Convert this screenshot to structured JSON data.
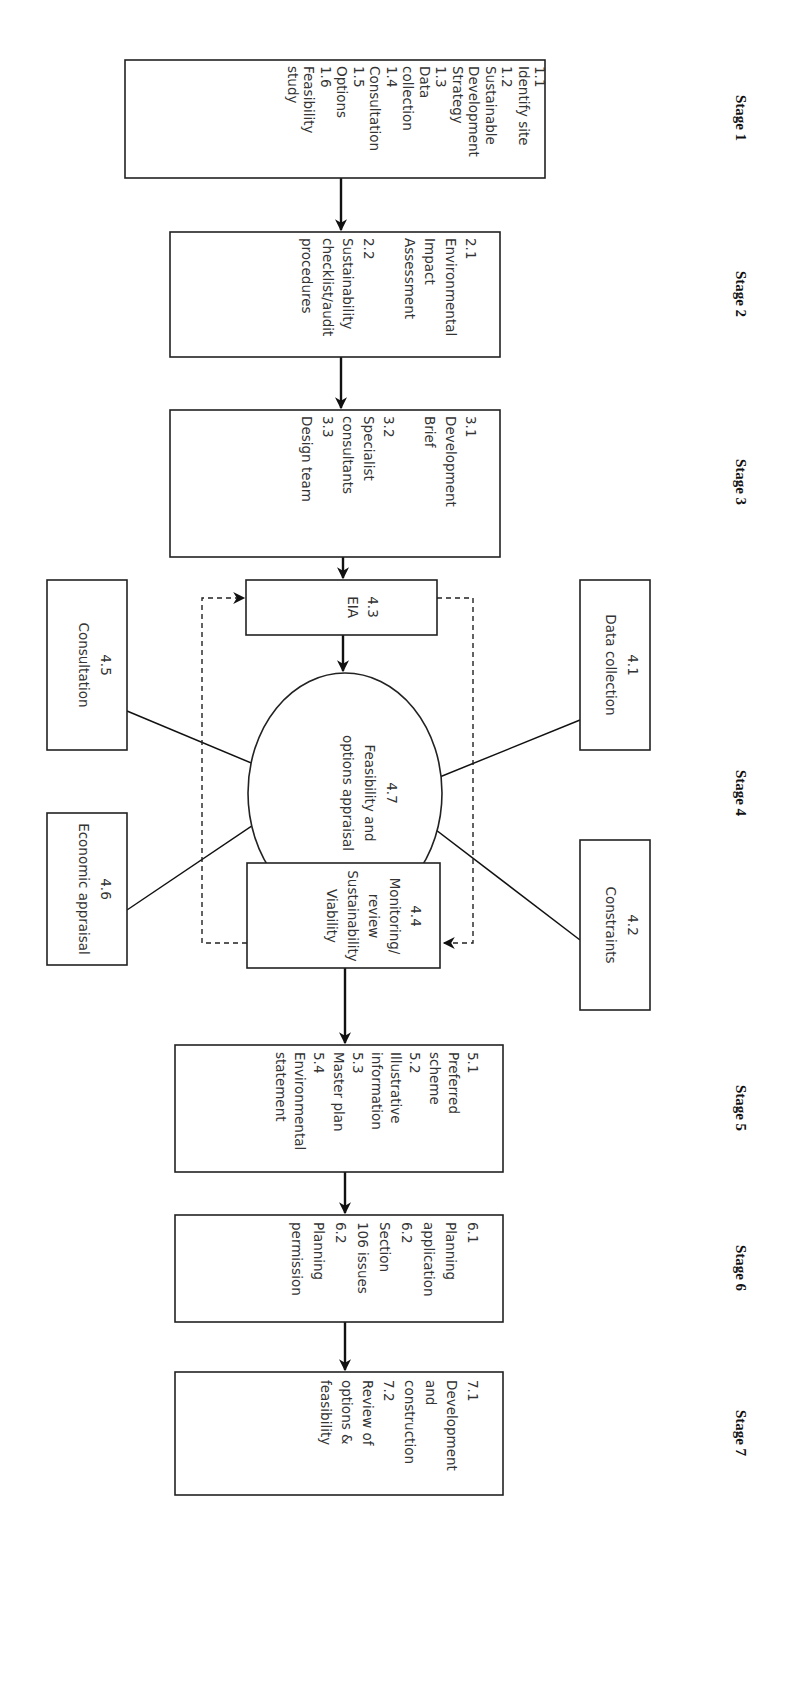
{
  "diagram": {
    "orientation": "rotated-90-clockwise",
    "stages": [
      {
        "label": "Stage 1"
      },
      {
        "label": "Stage 2"
      },
      {
        "label": "Stage 3"
      },
      {
        "label": "Stage 4"
      },
      {
        "label": "Stage 5"
      },
      {
        "label": "Stage 6"
      },
      {
        "label": "Stage 7"
      }
    ],
    "boxes": {
      "stage1": {
        "lines": [
          "1.1",
          "Identify site",
          "1.2",
          "Sustainable",
          "Development",
          "Strategy",
          "1.3",
          "Data",
          "collection",
          "1.4",
          "Consultation",
          "1.5",
          "Options",
          "1.6",
          "Feasibility",
          "study"
        ]
      },
      "stage2": {
        "lines": [
          "2.1",
          "Environmental",
          "Impact",
          "Assessment",
          "",
          "2.2",
          "Sustainability",
          "checklist/audit",
          "procedures"
        ]
      },
      "stage3": {
        "lines": [
          "3.1",
          "Development",
          "Brief",
          "",
          "3.2",
          "Specialist",
          "consultants",
          "3.3",
          "Design team"
        ]
      },
      "eia": {
        "lines": [
          "4.3",
          "EIA"
        ]
      },
      "data_collection": {
        "lines": [
          "4.1",
          "Data collection"
        ]
      },
      "constraints": {
        "lines": [
          "4.2",
          "Constraints"
        ]
      },
      "consultation": {
        "lines": [
          "4.5",
          "Consultation"
        ]
      },
      "economic": {
        "lines": [
          "4.6",
          "Economic appraisal"
        ]
      },
      "appraisal": {
        "lines": [
          "4.7",
          "Feasibility and",
          "options appraisal"
        ]
      },
      "monitoring": {
        "lines": [
          "4.4",
          "Monitoring/",
          "review",
          "Sustainability",
          "Viability"
        ]
      },
      "stage5": {
        "lines": [
          "5.1",
          "Preferred",
          "scheme",
          "5.2",
          "Illustrative",
          "information",
          "5.3",
          "Master plan",
          "5.4",
          "Environmental",
          "statement"
        ]
      },
      "stage6": {
        "lines": [
          "6.1",
          "Planning",
          "application",
          "6.2",
          "Section",
          "106 issues",
          "6.2",
          "Planning",
          "permission"
        ]
      },
      "stage7": {
        "lines": [
          "7.1",
          "Development",
          "and",
          "construction",
          "7.2",
          "Review of",
          "options &",
          "feasibility"
        ]
      }
    },
    "connections": [
      {
        "from": "stage1",
        "to": "stage2",
        "style": "solid"
      },
      {
        "from": "stage2",
        "to": "stage3",
        "style": "solid"
      },
      {
        "from": "stage3",
        "to": "eia",
        "style": "solid"
      },
      {
        "from": "eia",
        "to": "appraisal",
        "style": "solid"
      },
      {
        "from": "data_collection",
        "to": "appraisal",
        "style": "solid"
      },
      {
        "from": "constraints",
        "to": "appraisal",
        "style": "solid"
      },
      {
        "from": "consultation",
        "to": "appraisal",
        "style": "solid"
      },
      {
        "from": "economic",
        "to": "appraisal",
        "style": "solid"
      },
      {
        "from": "monitoring",
        "to": "appraisal",
        "style": "solid"
      },
      {
        "from": "monitoring",
        "to": "stage5",
        "style": "solid"
      },
      {
        "from": "eia",
        "to": "monitoring",
        "style": "dashed"
      },
      {
        "from": "monitoring",
        "to": "eia",
        "style": "dashed"
      },
      {
        "from": "stage5",
        "to": "stage6",
        "style": "solid"
      },
      {
        "from": "stage6",
        "to": "stage7",
        "style": "solid"
      }
    ]
  }
}
